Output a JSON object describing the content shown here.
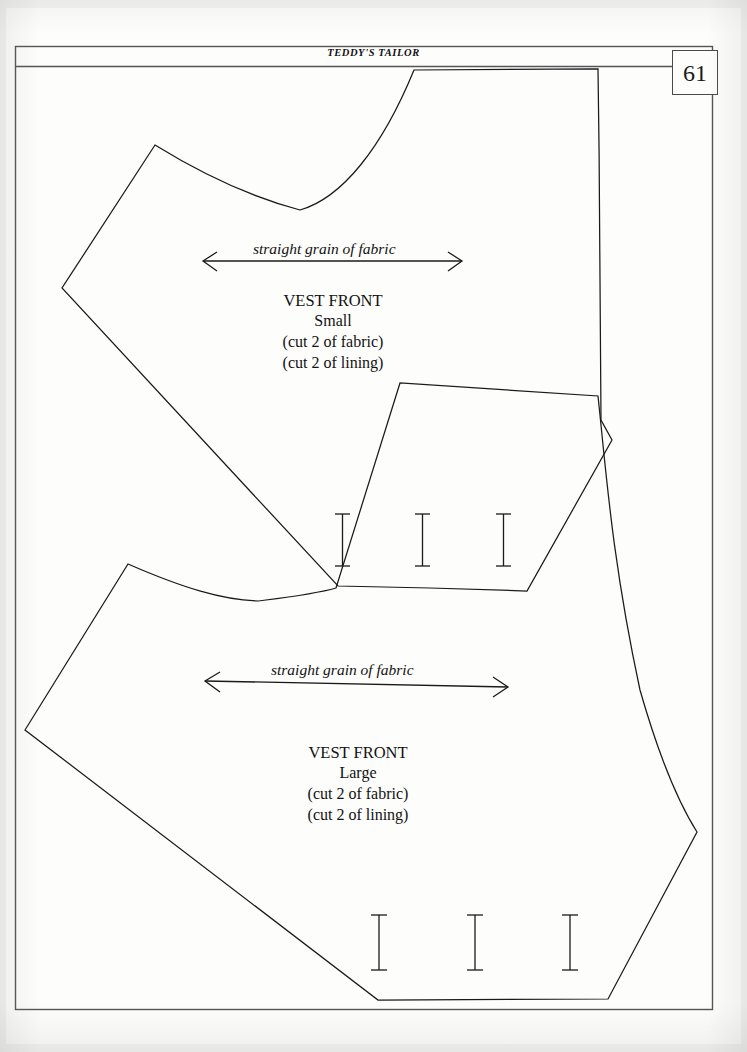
{
  "document": {
    "kind": "sewing-pattern-page",
    "running_head": "TEDDY'S TAILOR",
    "page_number": "61",
    "paper_color": "#fdfdfc",
    "ink_color": "#1a1a1a"
  },
  "pieces": [
    {
      "id": "vest-front-small",
      "grain_label": "straight grain of fabric",
      "title": "VEST FRONT",
      "size": "Small",
      "cut_fabric": "(cut 2 of fabric)",
      "cut_lining": "(cut 2 of lining)",
      "button_marks": 3
    },
    {
      "id": "vest-front-large",
      "grain_label": "straight grain of fabric",
      "title": "VEST FRONT",
      "size": "Large",
      "cut_fabric": "(cut 2 of fabric)",
      "cut_lining": "(cut 2 of lining)",
      "button_marks": 3
    }
  ]
}
